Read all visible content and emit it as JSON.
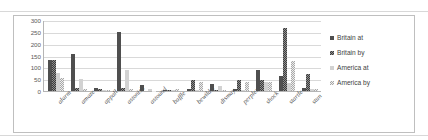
{
  "figure": {
    "clipped_caption": "",
    "background": "#ffffff",
    "frame_color": "#bfbfbf"
  },
  "legend": {
    "position": "right",
    "items": [
      {
        "label": "Britain at",
        "series_key": "britain_at",
        "swatch": "s0",
        "color": "#4f4f4f"
      },
      {
        "label": "Britain by",
        "series_key": "britain_by",
        "swatch": "s1",
        "color": "#8e8e8e"
      },
      {
        "label": "America at",
        "series_key": "america_at",
        "swatch": "s2",
        "color": "#d2d2d2"
      },
      {
        "label": "America by",
        "series_key": "america_by",
        "swatch": "s3",
        "color": "#ededed"
      }
    ]
  },
  "chart_data": {
    "type": "bar",
    "title": "",
    "xlabel": "",
    "ylabel": "",
    "ylim": [
      0,
      300
    ],
    "yticks": [
      0,
      50,
      100,
      150,
      200,
      250,
      300
    ],
    "ytick_labels": [
      "0",
      "50",
      "100",
      "150",
      "200",
      "250",
      "300"
    ],
    "grid": true,
    "grid_axis": "y",
    "legend_position": "right",
    "categories": [
      "alarm",
      "amaze",
      "appall",
      "astonish",
      "astound",
      "baffle",
      "bewilder",
      "dismay",
      "perplex",
      "shock",
      "startle",
      "stun"
    ],
    "series": [
      {
        "name": "Britain at",
        "values": [
          130,
          155,
          12,
          248,
          25,
          3,
          8,
          30,
          8,
          90,
          62,
          13
        ]
      },
      {
        "name": "Britain by",
        "values": [
          133,
          14,
          8,
          13,
          0,
          6,
          48,
          5,
          48,
          48,
          265,
          72
        ]
      },
      {
        "name": "America at",
        "values": [
          78,
          52,
          5,
          88,
          8,
          5,
          5,
          22,
          5,
          38,
          33,
          8
        ]
      },
      {
        "name": "America by",
        "values": [
          55,
          8,
          5,
          10,
          2,
          10,
          40,
          5,
          40,
          38,
          125,
          10
        ]
      }
    ]
  }
}
